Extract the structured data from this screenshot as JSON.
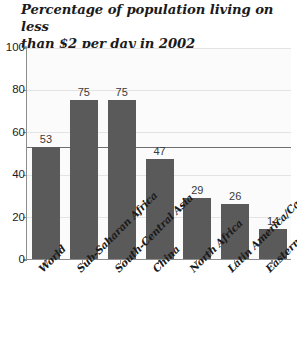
{
  "chart_data": {
    "type": "bar",
    "title": "Percentage of population living on less\nthan $2 per day in 2002",
    "xlabel": "",
    "ylabel": "",
    "ylim": [
      0,
      100
    ],
    "yticks": [
      0,
      20,
      40,
      60,
      80,
      100
    ],
    "ytick_labels": [
      "0",
      "20",
      "40",
      "60",
      "80",
      "100"
    ],
    "grid": true,
    "legend": false,
    "bar_color": "#5a5a5a",
    "categories": [
      "World",
      "Sub-Saharan Africa",
      "South-Central Asia",
      "China",
      "North Africa",
      "Latin America/Caribbean",
      "Eastern Europe"
    ],
    "values": [
      53,
      75,
      75,
      47,
      29,
      26,
      14
    ],
    "value_labels": [
      "53",
      "75",
      "75",
      "47",
      "29",
      "26",
      "14"
    ],
    "annotations": [
      {
        "name": "reference-line",
        "value": 53,
        "description": "Horizontal emphasis line at the World value level"
      }
    ]
  }
}
